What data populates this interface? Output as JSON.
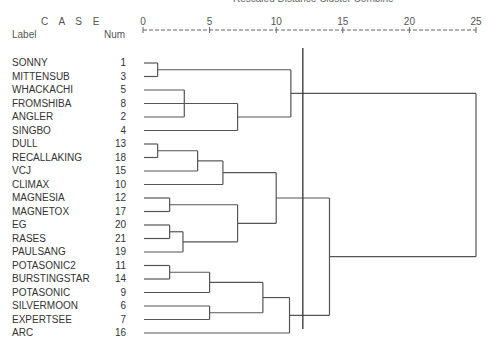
{
  "header": {
    "title": "Rescaled Distance Cluster Combine",
    "case_label": "C A S E",
    "label_col": "Label",
    "num_col": "Num"
  },
  "chart_data": {
    "type": "dendrogram",
    "title": "Rescaled Distance Cluster Combine",
    "xlabel": "Rescaled Distance",
    "x_ticks": [
      0,
      5,
      10,
      15,
      20,
      25
    ],
    "xlim": [
      0,
      25
    ],
    "cut_line_at": 12,
    "leaves": [
      {
        "label": "SONNY",
        "num": "1"
      },
      {
        "label": "MITTENSUB",
        "num": "3"
      },
      {
        "label": "WHACKACHI",
        "num": "5"
      },
      {
        "label": "FROMSHIBA",
        "num": "8"
      },
      {
        "label": "ANGLER",
        "num": "2"
      },
      {
        "label": "SINGBO",
        "num": "4"
      },
      {
        "label": "DULL",
        "num": "13"
      },
      {
        "label": "RECALLAKING",
        "num": "18"
      },
      {
        "label": "VCJ",
        "num": "15"
      },
      {
        "label": "CLIMAX",
        "num": "10"
      },
      {
        "label": "MAGNESIA",
        "num": "12"
      },
      {
        "label": "MAGNETOX",
        "num": "17"
      },
      {
        "label": "EG",
        "num": "20"
      },
      {
        "label": "RASES",
        "num": "21"
      },
      {
        "label": "PAULSANG",
        "num": "19"
      },
      {
        "label": "POTASONIC2",
        "num": "11"
      },
      {
        "label": "BURSTINGSTAR",
        "num": "14"
      },
      {
        "label": "POTASONIC",
        "num": "9"
      },
      {
        "label": "SILVERMOON",
        "num": "6"
      },
      {
        "label": "EXPERTSEE",
        "num": "7"
      },
      {
        "label": "ARC",
        "num": "16"
      }
    ],
    "merges": [
      {
        "id": "A",
        "children": [
          "L0",
          "L1"
        ],
        "distance": 1.1
      },
      {
        "id": "B",
        "children": [
          "L2",
          "L3",
          "L4"
        ],
        "distance": 3.1
      },
      {
        "id": "C",
        "children": [
          "B",
          "L5"
        ],
        "distance": 7.1
      },
      {
        "id": "D",
        "children": [
          "A",
          "C"
        ],
        "distance": 11.1
      },
      {
        "id": "E",
        "children": [
          "L6",
          "L7"
        ],
        "distance": 1.1
      },
      {
        "id": "F",
        "children": [
          "E",
          "L8"
        ],
        "distance": 4.1
      },
      {
        "id": "G",
        "children": [
          "F",
          "L9"
        ],
        "distance": 6.0
      },
      {
        "id": "H",
        "children": [
          "L10",
          "L11"
        ],
        "distance": 2.0
      },
      {
        "id": "I",
        "children": [
          "L12",
          "L13"
        ],
        "distance": 2.0
      },
      {
        "id": "J",
        "children": [
          "I",
          "L14"
        ],
        "distance": 3.0
      },
      {
        "id": "K",
        "children": [
          "H",
          "J"
        ],
        "distance": 7.1
      },
      {
        "id": "M",
        "children": [
          "G",
          "K"
        ],
        "distance": 10.0
      },
      {
        "id": "N",
        "children": [
          "L15",
          "L16"
        ],
        "distance": 2.0
      },
      {
        "id": "O",
        "children": [
          "N",
          "L17"
        ],
        "distance": 5.0
      },
      {
        "id": "P",
        "children": [
          "L18",
          "L19"
        ],
        "distance": 5.0
      },
      {
        "id": "Q",
        "children": [
          "O",
          "P"
        ],
        "distance": 9.0
      },
      {
        "id": "R",
        "children": [
          "Q",
          "L20"
        ],
        "distance": 11.0
      },
      {
        "id": "S",
        "children": [
          "M",
          "R"
        ],
        "distance": 14.0
      },
      {
        "id": "T",
        "children": [
          "D",
          "S"
        ],
        "distance": 25.0
      }
    ]
  },
  "colors": {
    "line": "#555555",
    "text": "#333333",
    "cut_line": "#333333"
  }
}
